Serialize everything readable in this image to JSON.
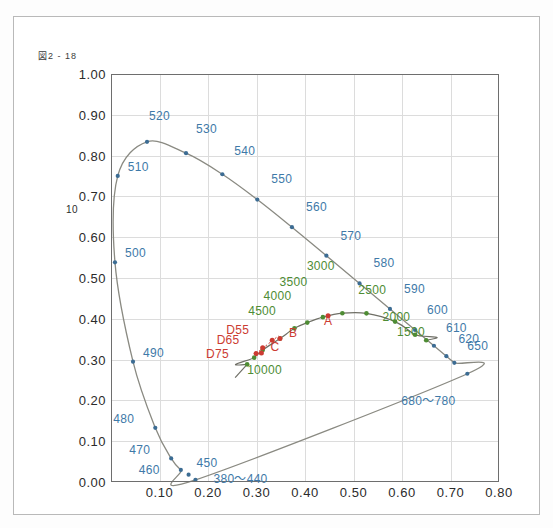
{
  "figure": {
    "caption_box": "図",
    "caption_text": "2 - 18"
  },
  "colors": {
    "locus_line": "#8a8a82",
    "wavelength_label": "#3e79a8",
    "wavelength_marker": "#3c6c93",
    "planckian_line": "#6f6f66",
    "cct_label": "#4e8c34",
    "cct_marker": "#4e8c34",
    "illuminant_label": "#cc3b32",
    "illuminant_marker": "#cc3b32",
    "grid": "#dcdcdc",
    "axis": "#6e6e6e",
    "frame": "#b9b9b9",
    "background": "#ffffff"
  },
  "chart_data": {
    "type": "scatter",
    "title": "",
    "xlabel": "",
    "ylabel": "",
    "xlim": [
      0.0,
      0.8
    ],
    "ylim": [
      0.0,
      1.0
    ],
    "grid": true,
    "legend": "none",
    "xticks": [
      "0.10",
      "0.20",
      "0.30",
      "0.40",
      "0.50",
      "0.60",
      "0.70",
      "0.80"
    ],
    "xtick_values": [
      0.1,
      0.2,
      0.3,
      0.4,
      0.5,
      0.6,
      0.7,
      0.8
    ],
    "yticks": [
      "1.00",
      "0.90",
      "0.80",
      "0.70",
      "0.60",
      "0.50",
      "0.40",
      "0.30",
      "0.20",
      "0.10",
      "0.00"
    ],
    "ytick_values": [
      1.0,
      0.9,
      0.8,
      0.7,
      0.6,
      0.5,
      0.4,
      0.3,
      0.2,
      0.1,
      0.0
    ],
    "y_axis_artifact": "10",
    "series": [
      {
        "name": "spectral-locus",
        "kind": "curve-with-markers",
        "color": "#8a8a82",
        "points": [
          {
            "x": 0.1741,
            "y": 0.005
          },
          {
            "x": 0.144,
            "y": 0.0297
          },
          {
            "x": 0.1241,
            "y": 0.0578
          },
          {
            "x": 0.0913,
            "y": 0.1327
          },
          {
            "x": 0.0454,
            "y": 0.295
          },
          {
            "x": 0.0082,
            "y": 0.5384
          },
          {
            "x": 0.0139,
            "y": 0.7502
          },
          {
            "x": 0.0743,
            "y": 0.8338
          },
          {
            "x": 0.1547,
            "y": 0.8059
          },
          {
            "x": 0.2296,
            "y": 0.7543
          },
          {
            "x": 0.3016,
            "y": 0.6923
          },
          {
            "x": 0.3731,
            "y": 0.6245
          },
          {
            "x": 0.4441,
            "y": 0.5547
          },
          {
            "x": 0.5125,
            "y": 0.4866
          },
          {
            "x": 0.5752,
            "y": 0.4242
          },
          {
            "x": 0.627,
            "y": 0.3725
          },
          {
            "x": 0.6658,
            "y": 0.334
          },
          {
            "x": 0.6915,
            "y": 0.3083
          },
          {
            "x": 0.7079,
            "y": 0.292
          },
          {
            "x": 0.7347,
            "y": 0.2653
          }
        ]
      },
      {
        "name": "planckian-locus",
        "kind": "curve-with-markers",
        "color": "#6f6f66",
        "points": [
          {
            "x": 0.6499,
            "y": 0.3474
          },
          {
            "x": 0.627,
            "y": 0.3608
          },
          {
            "x": 0.5857,
            "y": 0.3931
          },
          {
            "x": 0.5267,
            "y": 0.4133
          },
          {
            "x": 0.477,
            "y": 0.4137
          },
          {
            "x": 0.4369,
            "y": 0.4041
          },
          {
            "x": 0.4047,
            "y": 0.3907
          },
          {
            "x": 0.3782,
            "y": 0.3766
          },
          {
            "x": 0.3484,
            "y": 0.3516
          },
          {
            "x": 0.3128,
            "y": 0.3236
          },
          {
            "x": 0.2952,
            "y": 0.3048
          },
          {
            "x": 0.2807,
            "y": 0.2884
          }
        ]
      }
    ],
    "wavelength_markers": [
      {
        "label": "500",
        "x": 0.0082,
        "y": 0.5384,
        "lx": 10,
        "ly": -9
      },
      {
        "label": "510",
        "x": 0.0139,
        "y": 0.7502,
        "lx": 10,
        "ly": -9
      },
      {
        "label": "520",
        "x": 0.0743,
        "y": 0.8338,
        "lx": 2,
        "ly": -26
      },
      {
        "label": "530",
        "x": 0.1547,
        "y": 0.8059,
        "lx": 10,
        "ly": -24
      },
      {
        "label": "540",
        "x": 0.2296,
        "y": 0.7543,
        "lx": 12,
        "ly": -23
      },
      {
        "label": "550",
        "x": 0.3016,
        "y": 0.6923,
        "lx": 14,
        "ly": -21
      },
      {
        "label": "560",
        "x": 0.3731,
        "y": 0.6245,
        "lx": 14,
        "ly": -20
      },
      {
        "label": "570",
        "x": 0.4441,
        "y": 0.5547,
        "lx": 14,
        "ly": -20
      },
      {
        "label": "580",
        "x": 0.5125,
        "y": 0.4866,
        "lx": 14,
        "ly": -20
      },
      {
        "label": "590",
        "x": 0.5752,
        "y": 0.4242,
        "lx": 14,
        "ly": -20
      },
      {
        "label": "600",
        "x": 0.627,
        "y": 0.3725,
        "lx": 12,
        "ly": -20
      },
      {
        "label": "610",
        "x": 0.6658,
        "y": 0.334,
        "lx": 12,
        "ly": -18
      },
      {
        "label": "620",
        "x": 0.6915,
        "y": 0.3083,
        "lx": 12,
        "ly": -17
      },
      {
        "label": "650",
        "x": 0.7079,
        "y": 0.292,
        "lx": 13,
        "ly": -17
      },
      {
        "label": "490",
        "x": 0.0454,
        "y": 0.295,
        "lx": 10,
        "ly": -9
      },
      {
        "label": "480",
        "x": 0.0913,
        "y": 0.1327,
        "lx": -42,
        "ly": -9
      },
      {
        "label": "470",
        "x": 0.1241,
        "y": 0.0578,
        "lx": -42,
        "ly": -8
      },
      {
        "label": "460",
        "x": 0.144,
        "y": 0.0297,
        "lx": -42,
        "ly": 0
      },
      {
        "label": "450",
        "x": 0.16,
        "y": 0.018,
        "lx": 8,
        "ly": -12
      },
      {
        "label": "380～440",
        "x": 0.1741,
        "y": 0.005,
        "lx": 18,
        "ly": -4
      },
      {
        "label": "680～780",
        "x": 0.7347,
        "y": 0.2653,
        "lx": -66,
        "ly": 24
      }
    ],
    "cct_markers": [
      {
        "label": "10000",
        "x": 0.2807,
        "y": 0.2884,
        "lx": 0,
        "ly": 6
      },
      {
        "label": "4500",
        "x": 0.3612,
        "y": 0.3628,
        "lx": -38,
        "ly": -23
      },
      {
        "label": "4000",
        "x": 0.3805,
        "y": 0.3768,
        "lx": -32,
        "ly": -32
      },
      {
        "label": "3500",
        "x": 0.4053,
        "y": 0.3907,
        "lx": -28,
        "ly": -41
      },
      {
        "label": "3000",
        "x": 0.4369,
        "y": 0.4041,
        "lx": -16,
        "ly": -51
      },
      {
        "label": "2500",
        "x": 0.477,
        "y": 0.4137,
        "lx": 16,
        "ly": -23
      },
      {
        "label": "2000",
        "x": 0.5267,
        "y": 0.4133,
        "lx": 16,
        "ly": 4
      },
      {
        "label": "1500",
        "x": 0.5857,
        "y": 0.3931,
        "lx": 2,
        "ly": 10
      }
    ],
    "illuminant_markers": [
      {
        "label": "A",
        "x": 0.4476,
        "y": 0.4074,
        "lx": -4,
        "ly": 5
      },
      {
        "label": "B",
        "x": 0.3484,
        "y": 0.3516,
        "lx": 9,
        "ly": -6
      },
      {
        "label": "C",
        "x": 0.3101,
        "y": 0.3162,
        "lx": 9,
        "ly": -6
      },
      {
        "label": "D55",
        "x": 0.3324,
        "y": 0.3474,
        "lx": -46,
        "ly": -10
      },
      {
        "label": "D65",
        "x": 0.3127,
        "y": 0.329,
        "lx": -46,
        "ly": -8
      },
      {
        "label": "D75",
        "x": 0.299,
        "y": 0.3149,
        "lx": -50,
        "ly": 0
      }
    ]
  }
}
